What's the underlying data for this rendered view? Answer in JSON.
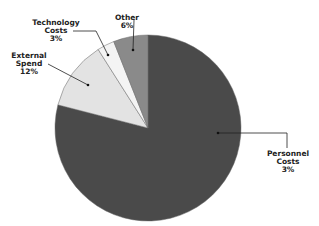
{
  "chart_data": {
    "type": "pie",
    "title": "",
    "slices": [
      {
        "label": "Personnel Costs",
        "display_pct": "3%",
        "value": 79,
        "color": "#4a4a4a"
      },
      {
        "label": "External Spend",
        "display_pct": "12%",
        "value": 12,
        "color": "#e3e3e3"
      },
      {
        "label": "Technology Costs",
        "display_pct": "3%",
        "value": 3,
        "color": "#f4f4f4"
      },
      {
        "label": "Other",
        "display_pct": "6%",
        "value": 6,
        "color": "#8a8a8a"
      }
    ],
    "legend": "none",
    "start_angle": "12 o'clock, clockwise"
  },
  "labels": {
    "personnel_l1": "Personnel",
    "personnel_l2": "Costs",
    "personnel_pct": "3%",
    "external_l1": "External",
    "external_l2": "Spend",
    "external_pct": "12%",
    "technology_l1": "Technology",
    "technology_l2": "Costs",
    "technology_pct": "3%",
    "other_l1": "Other",
    "other_pct": "6%"
  }
}
